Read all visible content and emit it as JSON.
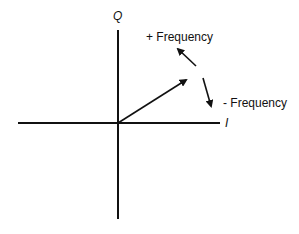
{
  "diagram": {
    "type": "IQ phasor diagram",
    "axes": {
      "vertical_label": "Q",
      "horizontal_label": "I"
    },
    "annotations": {
      "positive": "+ Frequency",
      "negative": "- Frequency"
    },
    "colors": {
      "stroke": "#111111",
      "background": "#ffffff"
    }
  }
}
